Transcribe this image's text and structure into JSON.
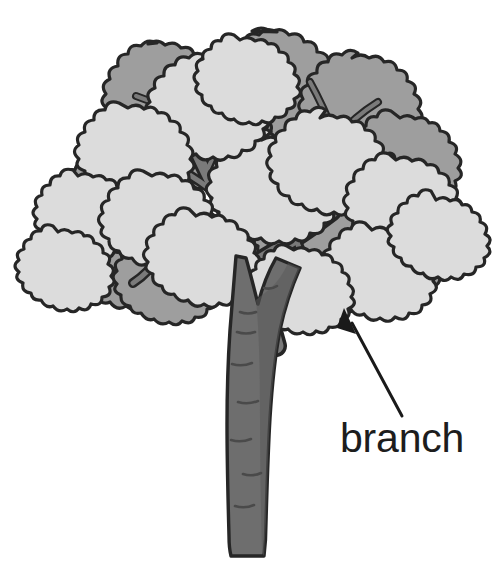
{
  "figure": {
    "background_color": "#ffffff"
  },
  "labels": [
    {
      "id": "branch",
      "text": "branch",
      "text_color": "#1d1d1d",
      "x": 340,
      "y": 452,
      "font_size": 41
    }
  ],
  "annotations": {
    "leader_arrow": {
      "name": "branch-arrow",
      "from_x": 402,
      "from_y": 416,
      "to_x": 344,
      "to_y": 309,
      "color": "#1a1a1a",
      "stroke_width": 3
    }
  },
  "palette": {
    "outline": "#262626",
    "foliage_light": "#dcdcdc",
    "foliage_dark": "#9e9e9e",
    "branch_fill": "#7a7a7a",
    "trunk_fill": "#6e6e6e",
    "trunk_shadow": "#5b5b5b",
    "bark_mark": "#4a4a4a",
    "background": "#ffffff"
  },
  "tree_parts": {
    "trunk": "trunk",
    "branches": "branches",
    "foliage_clusters": "leaf-clusters",
    "bark_marks": "bark-texture-marks"
  },
  "geometry": {
    "canopy_left": 30,
    "canopy_right": 472,
    "canopy_top": 30,
    "canopy_bottom": 300,
    "trunk_center_x": 245,
    "trunk_top_y": 250,
    "trunk_bottom_y": 558,
    "trunk_width": 36
  }
}
